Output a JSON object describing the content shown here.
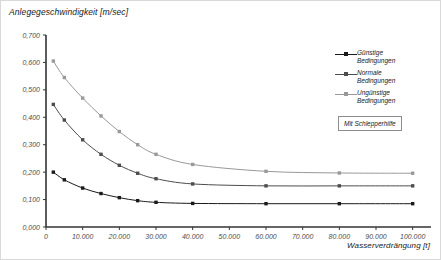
{
  "chart_data": {
    "type": "line",
    "title": "",
    "ylabel": "Anlegegeschwindigkeit [m/sec]",
    "xlabel": "Wasserverdrängung [t]",
    "xlim": [
      0,
      105000
    ],
    "ylim": [
      0.0,
      0.7
    ],
    "grid": false,
    "legend_position": "right",
    "x_tick_labels": [
      "0",
      "10.000",
      "20.000",
      "30.000",
      "40.000",
      "50.000",
      "60.000",
      "70.000",
      "80.000",
      "90.000",
      "100.000"
    ],
    "x_ticks": [
      0,
      10000,
      20000,
      30000,
      40000,
      50000,
      60000,
      70000,
      80000,
      90000,
      100000
    ],
    "y_tick_labels": [
      "0,000",
      "0,100",
      "0,200",
      "0,300",
      "0,400",
      "0,500",
      "0,600",
      "0,700"
    ],
    "y_ticks": [
      0.0,
      0.1,
      0.2,
      0.3,
      0.4,
      0.5,
      0.6,
      0.7
    ],
    "series": [
      {
        "name": "Günstige\nBedingungen",
        "color": "#1a1a1a",
        "x": [
          2000,
          5000,
          10000,
          15000,
          20000,
          25000,
          30000,
          40000,
          60000,
          80000,
          100000
        ],
        "values": [
          0.2,
          0.172,
          0.142,
          0.122,
          0.107,
          0.096,
          0.09,
          0.086,
          0.085,
          0.085,
          0.085
        ]
      },
      {
        "name": "Normale\nBedingungen",
        "color": "#4d4d4d",
        "x": [
          2000,
          5000,
          10000,
          15000,
          20000,
          25000,
          30000,
          40000,
          60000,
          80000,
          100000
        ],
        "values": [
          0.447,
          0.39,
          0.318,
          0.265,
          0.225,
          0.196,
          0.176,
          0.157,
          0.15,
          0.15,
          0.15
        ]
      },
      {
        "name": "Ungünstige\nBedingungen",
        "color": "#999999",
        "x": [
          2000,
          5000,
          10000,
          15000,
          20000,
          25000,
          30000,
          40000,
          60000,
          80000,
          100000
        ],
        "values": [
          0.605,
          0.545,
          0.47,
          0.405,
          0.348,
          0.3,
          0.265,
          0.228,
          0.203,
          0.197,
          0.196
        ]
      }
    ],
    "annotation": "Mit Schlepperhilfe"
  }
}
